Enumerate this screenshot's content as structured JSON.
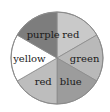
{
  "spinner": {
    "center": [
      57,
      58
    ],
    "radius": 46,
    "sectors": [
      {
        "label": "red",
        "fill": "#c9c9c9",
        "start_deg": 0,
        "end_deg": 60
      },
      {
        "label": "green",
        "fill": "#b9b9b9",
        "start_deg": 60,
        "end_deg": 120
      },
      {
        "label": "blue",
        "fill": "#9c9c9c",
        "start_deg": 120,
        "end_deg": 180
      },
      {
        "label": "red",
        "fill": "#bdbdbd",
        "start_deg": 180,
        "end_deg": 240
      },
      {
        "label": "yellow",
        "fill": "#ffffff",
        "start_deg": 240,
        "end_deg": 300
      },
      {
        "label": "purple",
        "fill": "#7d7d7d",
        "start_deg": 300,
        "end_deg": 360
      }
    ],
    "outline_color": "#8a8a8a"
  }
}
